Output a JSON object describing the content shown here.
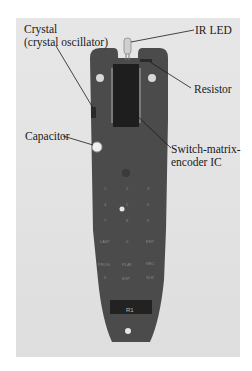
{
  "figure": {
    "labels": {
      "crystal_line1": "Crystal",
      "crystal_line2": "(crystal oscillator)",
      "ir_led": "IR LED",
      "resistor": "Resistor",
      "capacitor": "Capacitor",
      "ic_line1": "Switch-matrix-",
      "ic_line2": "encoder IC"
    },
    "pcb_silkscreen": {
      "keys": [
        "1",
        "2",
        "3",
        "4",
        "5",
        "6",
        "7",
        "8",
        "9",
        "LAST",
        "0",
        "ENT",
        "PROG",
        "PLAY",
        "REC",
        "II",
        "EXP",
        "SLR"
      ],
      "part_marking": "R1"
    },
    "colors": {
      "background": "#e3e3e3",
      "pcb": "#4a4a4a",
      "ic": "#1e1e1e",
      "label_text": "#1a1a1a"
    }
  }
}
